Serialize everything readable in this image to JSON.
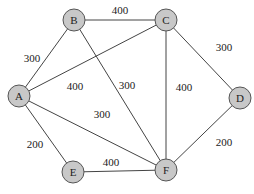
{
  "graph": {
    "nodes": [
      {
        "id": "A",
        "label": "A",
        "x": 19,
        "y": 96
      },
      {
        "id": "B",
        "label": "B",
        "x": 74,
        "y": 20
      },
      {
        "id": "C",
        "label": "C",
        "x": 166,
        "y": 20
      },
      {
        "id": "D",
        "label": "D",
        "x": 240,
        "y": 98
      },
      {
        "id": "E",
        "label": "E",
        "x": 73,
        "y": 172
      },
      {
        "id": "F",
        "label": "F",
        "x": 166,
        "y": 170
      }
    ],
    "edges": [
      {
        "from": "B",
        "to": "C",
        "weight": "400",
        "lx": 120,
        "ly": 10
      },
      {
        "from": "A",
        "to": "B",
        "weight": "300",
        "lx": 32,
        "ly": 58
      },
      {
        "from": "A",
        "to": "C",
        "weight": "400",
        "lx": 75,
        "ly": 86
      },
      {
        "from": "B",
        "to": "F",
        "weight": "300",
        "lx": 127,
        "ly": 85
      },
      {
        "from": "C",
        "to": "F",
        "weight": "400",
        "lx": 184,
        "ly": 87
      },
      {
        "from": "C",
        "to": "D",
        "weight": "300",
        "lx": 224,
        "ly": 47
      },
      {
        "from": "A",
        "to": "F",
        "weight": "300",
        "lx": 102,
        "ly": 114
      },
      {
        "from": "A",
        "to": "E",
        "weight": "200",
        "lx": 35,
        "ly": 144
      },
      {
        "from": "E",
        "to": "F",
        "weight": "400",
        "lx": 111,
        "ly": 162
      },
      {
        "from": "D",
        "to": "F",
        "weight": "200",
        "lx": 224,
        "ly": 142
      }
    ]
  },
  "colors": {
    "node_fill": "#c8c8c8",
    "node_stroke": "#555555",
    "edge": "#444444"
  }
}
